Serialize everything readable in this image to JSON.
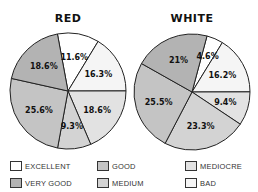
{
  "chart_data": [
    {
      "type": "pie",
      "title": "RED",
      "start_angle_deg": -10.5,
      "direction": "clockwise",
      "slices": [
        {
          "label": "EXCELLENT",
          "value": 11.6,
          "text": "11.6%"
        },
        {
          "label": "BAD",
          "value": 16.3,
          "text": "16.3%"
        },
        {
          "label": "MEDIOCRE",
          "value": 18.6,
          "text": "18.6%"
        },
        {
          "label": "MEDIUM",
          "value": 9.3,
          "text": "9.3%"
        },
        {
          "label": "GOOD",
          "value": 25.6,
          "text": "25.6%"
        },
        {
          "label": "VERY GOOD",
          "value": 18.6,
          "text": "18.6%"
        }
      ]
    },
    {
      "type": "pie",
      "title": "WHITE",
      "start_angle_deg": 15,
      "direction": "clockwise",
      "slices": [
        {
          "label": "EXCELLENT",
          "value": 4.6,
          "text": "4.6%"
        },
        {
          "label": "BAD",
          "value": 16.2,
          "text": "16.2%"
        },
        {
          "label": "MEDIOCRE",
          "value": 9.4,
          "text": "9.4%"
        },
        {
          "label": "MEDIUM",
          "value": 23.3,
          "text": "23.3%"
        },
        {
          "label": "GOOD",
          "value": 25.5,
          "text": "25.5%"
        },
        {
          "label": "VERY GOOD",
          "value": 21,
          "text": "21%"
        }
      ]
    }
  ],
  "titles": {
    "red": "RED",
    "white": "WHITE"
  },
  "legend": [
    {
      "label": "EXCELLENT",
      "color": "#ffffff"
    },
    {
      "label": "GOOD",
      "color": "#c4c4c4"
    },
    {
      "label": "MEDIOCRE",
      "color": "#e2e2e2"
    },
    {
      "label": "VERY GOOD",
      "color": "#b3b3b3"
    },
    {
      "label": "MEDIUM",
      "color": "#d3d3d3"
    },
    {
      "label": "BAD",
      "color": "#f5f5f5"
    }
  ],
  "colors": {
    "EXCELLENT": "#ffffff",
    "BAD": "#f5f5f5",
    "MEDIOCRE": "#e2e2e2",
    "MEDIUM": "#d3d3d3",
    "GOOD": "#c4c4c4",
    "VERY GOOD": "#b3b3b3"
  }
}
